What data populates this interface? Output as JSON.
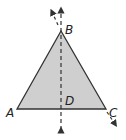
{
  "diagram": {
    "type": "geometry-triangle",
    "fill_color": "#cfcfcf",
    "stroke_color": "#333333",
    "points": {
      "A": {
        "label": "A",
        "x": 17,
        "y": 109
      },
      "B": {
        "label": "B",
        "x": 61,
        "y": 31
      },
      "C": {
        "label": "C",
        "x": 106,
        "y": 109
      },
      "D": {
        "label": "D",
        "x": 61,
        "y": 109
      }
    },
    "labels": {
      "A": "A",
      "B": "B",
      "C": "C",
      "D": "D"
    },
    "lines": [
      {
        "name": "vertical-dashed-line-BD",
        "style": "dashed",
        "arrows": "both"
      },
      {
        "name": "dashed-extension-BC",
        "style": "dashed",
        "arrows": "both"
      }
    ]
  }
}
